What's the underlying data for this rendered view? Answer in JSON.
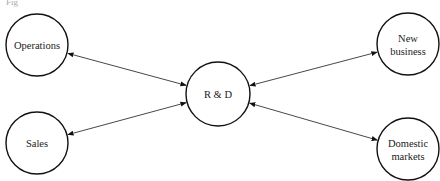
{
  "diagram": {
    "type": "hub-and-spoke",
    "top_fragment": "Fig",
    "hub": {
      "id": "rd",
      "label": "R & D",
      "cx": 218,
      "cy": 94,
      "r": 32
    },
    "nodes": [
      {
        "id": "operations",
        "lines": [
          "Operations"
        ],
        "cx": 37,
        "cy": 45,
        "r": 31
      },
      {
        "id": "sales",
        "lines": [
          "Sales"
        ],
        "cx": 37,
        "cy": 143,
        "r": 31
      },
      {
        "id": "new-business",
        "lines": [
          "New",
          "business"
        ],
        "cx": 408,
        "cy": 44,
        "r": 31
      },
      {
        "id": "domestic-markets",
        "lines": [
          "Domestic",
          "markets"
        ],
        "cx": 408,
        "cy": 149,
        "r": 31
      }
    ],
    "edges": [
      {
        "from": "operations",
        "to": "rd",
        "arrow": "both"
      },
      {
        "from": "sales",
        "to": "rd",
        "arrow": "both"
      },
      {
        "from": "new-business",
        "to": "rd",
        "arrow": "both"
      },
      {
        "from": "domestic-markets",
        "to": "rd",
        "arrow": "both"
      }
    ],
    "colors": {
      "stroke": "#111111",
      "edge": "#333333",
      "text": "#222222",
      "background": "#ffffff"
    }
  }
}
